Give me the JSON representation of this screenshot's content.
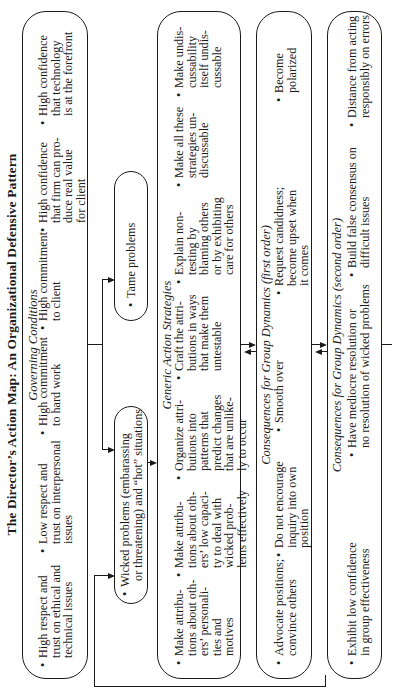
{
  "title": "The Director’s Action Map: An Organizational Defensive Pattern",
  "governing_conditions": {
    "label": "Governing Conditions",
    "items": [
      "High respect and\ntrust on ethical and\ntechnical issues",
      "Low respect and\ntrust on interpersonal\nissues",
      "High commitment\nto hard work",
      "High commitment\nto client",
      "High confidence\nthat firm can pro-\nduce real value\nfor client",
      "High confidence\nthat technology\nis at the forefront"
    ]
  },
  "problems": {
    "wicked": "Wicked problems (embarassing\n  or threatening) and “hot” situations",
    "tame": "Tame problems"
  },
  "generic_action_strategies": {
    "label": "Generic Action Strategies",
    "items": [
      "Make attribu-\ntions about oth-\ners’ personali-\nties and\nmotives",
      "Make attribu-\ntions about oth-\ners’ low capaci-\nty to deal with\nwicked prob-\nlems effectively",
      "Organize attri-\nbutions into\npatterns that\npredict changes\nthat are unlike-\nly to occur",
      "Craft the attri-\nbutions in ways\nthat make them\nuntestable",
      "Explain non-\ntesting by\nblaming others\nor by exhibiting\ncare for others",
      "Make all these\nstrategies un-\ndiscussable",
      "Make undis-\ncussability\nitself undis-\ncussable"
    ]
  },
  "consequences_first": {
    "label": "Consequences for Group Dynamics (first order)",
    "items": [
      "Advocate positions;\nconvince others",
      "Do not encourage\ninquiry into own\nposition",
      "Smooth over",
      "Request candidness;\nbecome upset when\nit comes",
      "Become\npolarized"
    ]
  },
  "consequences_second": {
    "label": "Consequences for Group Dynamics (second order)",
    "items": [
      "Exhibit low confidence\nin group effectiveness",
      "Have mediocre resolution or\nno resolution of wicked problems",
      "Build false consensus on\ndifficult issues",
      "Distance from acting\nresponsibly on errors"
    ]
  },
  "bullet": "•",
  "colors": {
    "ink": "#1a1a1a",
    "background": "#ffffff"
  }
}
